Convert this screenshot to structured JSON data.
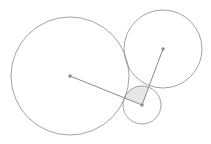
{
  "diagram": {
    "width": 211,
    "height": 144,
    "stroke_color": "#8a8a8a",
    "dot_color": "#8a8a8a",
    "sector_fill": "#e6e6e6",
    "circles": [
      {
        "name": "large-circle",
        "cx": 70,
        "cy": 76,
        "r": 59
      },
      {
        "name": "upper-right-circle",
        "cx": 163,
        "cy": 49,
        "r": 39
      },
      {
        "name": "small-circle",
        "cx": 142,
        "cy": 105,
        "r": 19
      }
    ],
    "segments": [
      {
        "name": "segment-large-to-small",
        "x1": 70,
        "y1": 76,
        "x2": 142,
        "y2": 105
      },
      {
        "name": "segment-upper-to-small",
        "x1": 163,
        "y1": 49,
        "x2": 142,
        "y2": 105
      }
    ],
    "sector": {
      "cx": 142,
      "cy": 105,
      "r": 19
    }
  }
}
